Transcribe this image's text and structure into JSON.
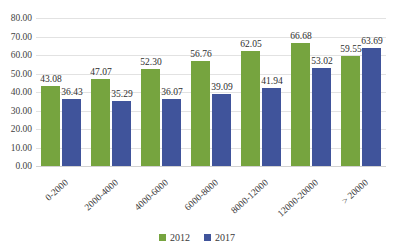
{
  "chart_data": {
    "type": "bar",
    "title": "",
    "subtitle": "",
    "xlabel": "",
    "ylabel": "",
    "ylim": [
      0,
      80
    ],
    "ytick_step": 10,
    "ytick_labels": [
      "0.00",
      "10.00",
      "20.00",
      "30.00",
      "40.00",
      "50.00",
      "60.00",
      "70.00",
      "80.00"
    ],
    "ytick_values": [
      0,
      10,
      20,
      30,
      40,
      50,
      60,
      70,
      80
    ],
    "grid": "horizontal",
    "legend_position": "bottom-center",
    "categories": [
      "0-2000",
      "2000-4000",
      "4000-6000",
      "6000-8000",
      "8000-12000",
      "12000-20000",
      "> 20000"
    ],
    "series": [
      {
        "name": "2012",
        "color": "#76a43f",
        "values": [
          43.08,
          47.07,
          52.3,
          56.76,
          62.05,
          66.68,
          59.55
        ],
        "labels": [
          "43.08",
          "47.07",
          "52.30",
          "56.76",
          "62.05",
          "66.68",
          "59.55"
        ]
      },
      {
        "name": "2017",
        "color": "#40549b",
        "values": [
          36.43,
          35.29,
          36.07,
          39.09,
          41.94,
          53.02,
          63.69
        ],
        "labels": [
          "36.43",
          "35.29",
          "36.07",
          "39.09",
          "41.94",
          "53.02",
          "63.69"
        ]
      }
    ]
  },
  "legend": {
    "items": [
      {
        "label": "2012",
        "color": "#76a43f"
      },
      {
        "label": "2017",
        "color": "#40549b"
      }
    ]
  },
  "colors": {
    "series_2012": "#76a43f",
    "series_2017": "#40549b",
    "gridline": "#e2e2e2",
    "axis": "#d2d2d2",
    "background": "#ffffff",
    "text": "#3a3a3a"
  }
}
